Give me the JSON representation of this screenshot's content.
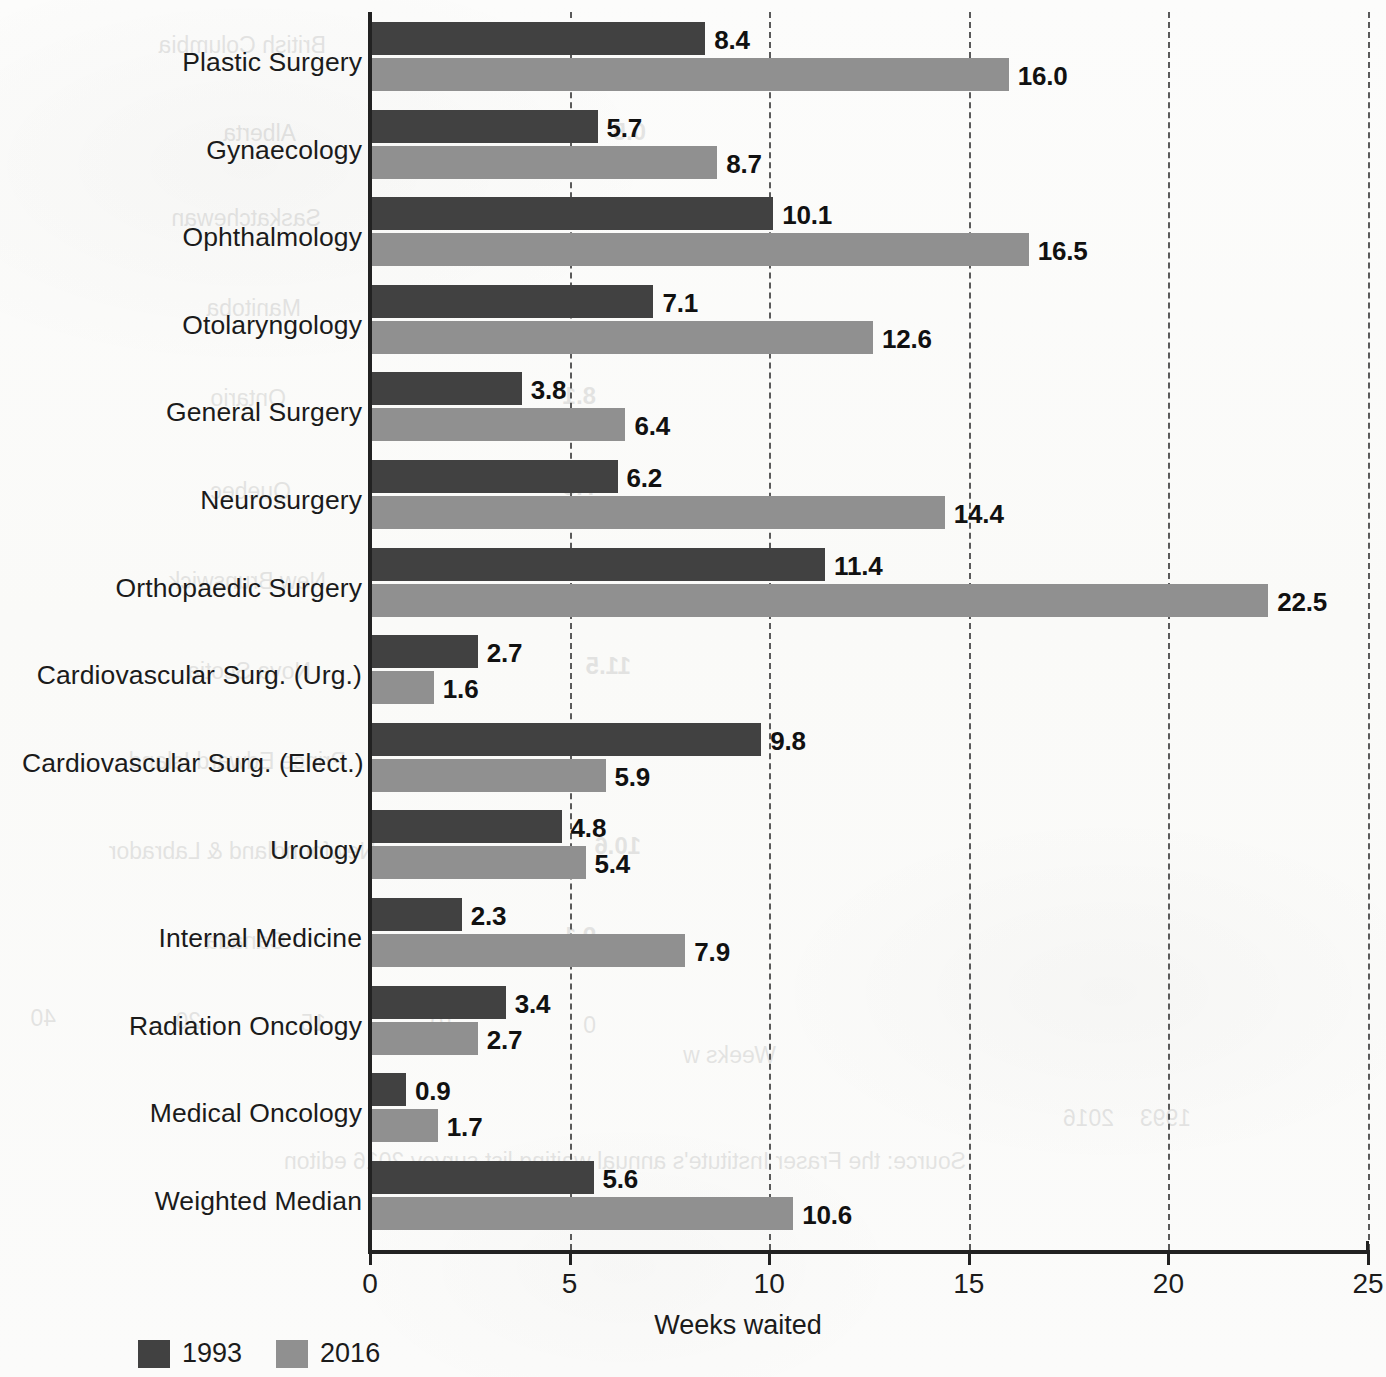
{
  "chart_data": {
    "type": "bar",
    "orientation": "horizontal",
    "title": "",
    "xlabel": "Weeks waited",
    "ylabel": "",
    "xlim": [
      0,
      25
    ],
    "xticks": [
      0,
      5,
      10,
      15,
      20,
      25
    ],
    "xtick_labels": [
      "0",
      "5",
      "10",
      "15",
      "20",
      "25"
    ],
    "grid": true,
    "grid_style": "dashed vertical",
    "legend_position": "bottom-left",
    "categories": [
      "Plastic Surgery",
      "Gynaecology",
      "Ophthalmology",
      "Otolaryngology",
      "General Surgery",
      "Neurosurgery",
      "Orthopaedic Surgery",
      "Cardiovascular Surg. (Urg.)",
      "Cardiovascular Surg. (Elect.)",
      "Urology",
      "Internal Medicine",
      "Radiation Oncology",
      "Medical Oncology",
      "Weighted Median"
    ],
    "series": [
      {
        "name": "1993",
        "color": "#414141",
        "values": [
          8.4,
          5.7,
          10.1,
          7.1,
          3.8,
          6.2,
          11.4,
          2.7,
          9.8,
          4.8,
          2.3,
          3.4,
          0.9,
          5.6
        ],
        "labels": [
          "8.4",
          "5.7",
          "10.1",
          "7.1",
          "3.8",
          "6.2",
          "11.4",
          "2.7",
          "9.8",
          "4.8",
          "2.3",
          "3.4",
          "0.9",
          "5.6"
        ]
      },
      {
        "name": "2016",
        "color": "#909090",
        "values": [
          16.0,
          8.7,
          16.5,
          12.6,
          6.4,
          14.4,
          22.5,
          1.6,
          5.9,
          5.4,
          7.9,
          2.7,
          1.7,
          10.6
        ],
        "labels": [
          "16.0",
          "8.7",
          "16.5",
          "12.6",
          "6.4",
          "14.4",
          "22.5",
          "1.6",
          "5.9",
          "5.4",
          "7.9",
          "2.7",
          "1.7",
          "10.6"
        ]
      }
    ]
  },
  "legend": {
    "entries": [
      {
        "label": "1993",
        "color": "#414141"
      },
      {
        "label": "2016",
        "color": "#909090"
      }
    ]
  },
  "axis": {
    "x_title": "Weeks waited"
  },
  "bleed_through": [
    {
      "text": "British Columbia",
      "x": 1060,
      "y": 32
    },
    {
      "text": "Alberta",
      "x": 1090,
      "y": 120
    },
    {
      "text": "0.5",
      "x": 740,
      "y": 118,
      "bold": true
    },
    {
      "text": "Saskatchewan",
      "x": 1065,
      "y": 205
    },
    {
      "text": "Manitoba",
      "x": 1085,
      "y": 295
    },
    {
      "text": "0.5",
      "x": 745,
      "y": 295,
      "bold": true
    },
    {
      "text": "Ontario",
      "x": 1100,
      "y": 385
    },
    {
      "text": "8.1",
      "x": 790,
      "y": 382,
      "bold": true
    },
    {
      "text": "Quebec",
      "x": 1095,
      "y": 478
    },
    {
      "text": "7.3",
      "x": 790,
      "y": 473,
      "bold": true
    },
    {
      "text": "New Brunswick",
      "x": 1060,
      "y": 568
    },
    {
      "text": "Nova Scotia",
      "x": 1075,
      "y": 658
    },
    {
      "text": "11.5",
      "x": 755,
      "y": 652,
      "bold": true
    },
    {
      "text": "Prince Edward Island",
      "x": 1040,
      "y": 748
    },
    {
      "text": "Newfoundland & Labrador",
      "x": 1010,
      "y": 838
    },
    {
      "text": "10.6",
      "x": 745,
      "y": 832,
      "bold": true
    },
    {
      "text": "Canada",
      "x": 1100,
      "y": 928
    },
    {
      "text": "9.1",
      "x": 790,
      "y": 922,
      "bold": true
    },
    {
      "text": "0",
      "x": 790,
      "y": 1012
    },
    {
      "text": "10",
      "x": 930,
      "y": 1010
    },
    {
      "text": "15",
      "x": 1060,
      "y": 1010
    },
    {
      "text": "20",
      "x": 1185,
      "y": 1008
    },
    {
      "text": "40",
      "x": 1330,
      "y": 1005
    },
    {
      "text": "Weeks w",
      "x": 610,
      "y": 1042
    },
    {
      "text": "Source: the Fraser Institute's annual waiting list survey 2016 editon",
      "x": 420,
      "y": 1148
    },
    {
      "text": "1993",
      "x": 195,
      "y": 1105
    },
    {
      "text": "2016",
      "x": 272,
      "y": 1105
    }
  ]
}
